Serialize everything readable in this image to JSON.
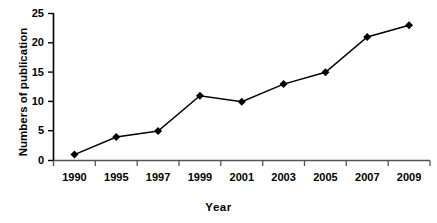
{
  "chart_data": {
    "type": "line",
    "title": "",
    "xlabel": "Year",
    "ylabel": "Numbers of publication",
    "categories": [
      "1990",
      "1995",
      "1997",
      "1999",
      "2001",
      "2003",
      "2005",
      "2007",
      "2009"
    ],
    "values": [
      1,
      4,
      5,
      11,
      10,
      13,
      15,
      21,
      23
    ],
    "series": [
      {
        "name": "Numbers of publication",
        "values": [
          1,
          4,
          5,
          11,
          10,
          13,
          15,
          21,
          23
        ]
      }
    ],
    "ylim": [
      0,
      25
    ],
    "yticks": [
      0,
      5,
      10,
      15,
      20,
      25
    ],
    "ytick_labels": [
      "0",
      "5",
      "10",
      "15",
      "20",
      "25"
    ],
    "grid": false,
    "legend": false,
    "legend_position": "none",
    "marker": "diamond",
    "line_color": "#000000",
    "marker_color": "#000000",
    "axis_color": "#000000",
    "background_color": "#ffffff"
  },
  "axes": {
    "y_title": "Numbers of publication",
    "x_title": "Year"
  },
  "ytick_labels": {
    "0": "25",
    "1": "20",
    "2": "15",
    "3": "10",
    "4": "5",
    "5": "0"
  },
  "xtick_labels": {
    "0": "1990",
    "1": "1995",
    "2": "1997",
    "3": "1999",
    "4": "2001",
    "5": "2003",
    "6": "2005",
    "7": "2007",
    "8": "2009"
  }
}
